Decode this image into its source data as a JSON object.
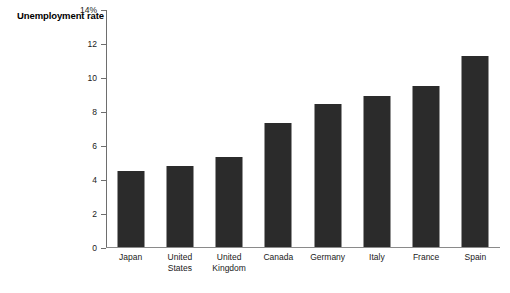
{
  "chart_data": {
    "type": "bar",
    "title": "Unemployment rate",
    "title_lines": [
      "Unemployment",
      "rate"
    ],
    "xlabel": "",
    "ylabel": "Unemployment rate",
    "categories": [
      "Japan",
      "United States",
      "United Kingdom",
      "Canada",
      "Germany",
      "Italy",
      "France",
      "Spain"
    ],
    "category_lines": [
      [
        "Japan"
      ],
      [
        "United",
        "States"
      ],
      [
        "United",
        "Kingdom"
      ],
      [
        "Canada"
      ],
      [
        "Germany"
      ],
      [
        "Italy"
      ],
      [
        "France"
      ],
      [
        "Spain"
      ]
    ],
    "values": [
      4.5,
      4.8,
      5.3,
      7.3,
      8.45,
      8.95,
      9.5,
      11.3
    ],
    "ylim": [
      0,
      14
    ],
    "yticks": [
      0,
      2,
      4,
      6,
      8,
      10,
      12,
      14
    ],
    "ytick_labels": [
      "0",
      "2",
      "4",
      "6",
      "8",
      "10",
      "12",
      "14%"
    ],
    "grid": false,
    "legend": false,
    "bar_color": "#2b2b2b",
    "axis_color": "#6e6e6e"
  }
}
